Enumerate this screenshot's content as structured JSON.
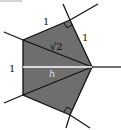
{
  "diagram": {
    "type": "geometry-figure",
    "colors": {
      "fill": "#6e6e6e",
      "stroke": "#111111",
      "height_line": "#ffffff",
      "background": "#ffffff"
    },
    "labels": {
      "top_left_edge": "1",
      "top_right_edge": "1",
      "diagonal": "√2",
      "left_edge": "1",
      "height": "h"
    },
    "right_angle_marks": 2
  }
}
